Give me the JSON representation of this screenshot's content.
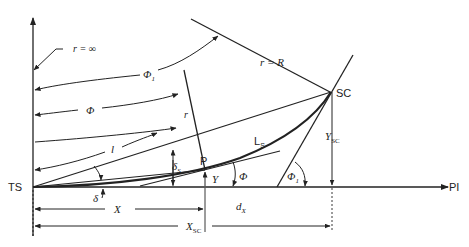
{
  "diagram": {
    "points": {
      "ts": "TS",
      "sc": "SC",
      "pi": "PI",
      "p": "P"
    },
    "radius_labels": {
      "r_infinity": "r = ∞",
      "r_equals_R": "r = R",
      "r": "r"
    },
    "angle_labels": {
      "phi1_top": "Φ",
      "phi1_sub": "1",
      "phi": "Φ",
      "phi_small": "Φ",
      "phi1_right": "Φ",
      "phi1_right_sub": "1",
      "delta": "δ",
      "delta_s": "δ",
      "delta_s_sub": "S"
    },
    "length_labels": {
      "l": "l",
      "ls": "L",
      "ls_sub": "S",
      "y": "Y",
      "ysc": "Y",
      "ysc_sub": "SC",
      "x": "X",
      "xsc": "X",
      "xsc_sub": "SC",
      "dx": "d",
      "dx_sub": "X"
    }
  }
}
